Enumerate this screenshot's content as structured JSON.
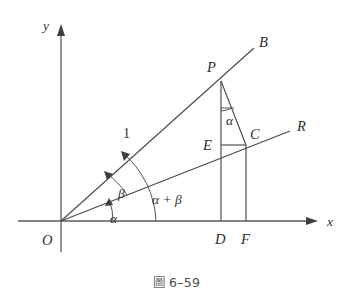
{
  "figure": {
    "caption_symbol": "圖",
    "caption_number": "6–59",
    "axes": {
      "x_label": "x",
      "y_label": "y",
      "origin_label": "O"
    },
    "points": [
      {
        "key": "P",
        "label": "P"
      },
      {
        "key": "B",
        "label": "B"
      },
      {
        "key": "C",
        "label": "C"
      },
      {
        "key": "R",
        "label": "R"
      },
      {
        "key": "E",
        "label": "E"
      },
      {
        "key": "D",
        "label": "D"
      },
      {
        "key": "F",
        "label": "F"
      }
    ],
    "segment_labels": [
      {
        "key": "OP_length",
        "label": "1"
      }
    ],
    "angle_labels": [
      {
        "key": "alpha_origin",
        "label": "α"
      },
      {
        "key": "beta_origin",
        "label": "β"
      },
      {
        "key": "alpha_plus_beta",
        "label": "α + β"
      },
      {
        "key": "alpha_at_P",
        "label": "α"
      }
    ],
    "colors": {
      "line": "#4a4a4a",
      "axis": "#5a5a5a",
      "label": "#2e2e2e",
      "background": "#ffffff",
      "caption": "#4d4d4d"
    }
  }
}
